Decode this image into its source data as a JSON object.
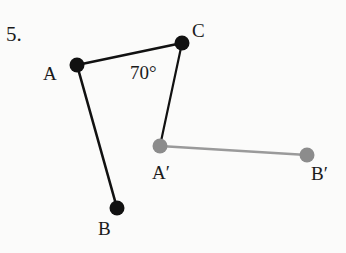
{
  "problem": {
    "number": "5."
  },
  "colors": {
    "original": "#111111",
    "image": "#8c8c8c",
    "image_line": "#9a9a9a",
    "background": "#fbfbfa"
  },
  "points": {
    "A": {
      "label": "A",
      "x": 77,
      "y": 65
    },
    "B": {
      "label": "B",
      "x": 117,
      "y": 208
    },
    "C": {
      "label": "C",
      "x": 182,
      "y": 43
    },
    "A_prime": {
      "label": "A′",
      "x": 160,
      "y": 146
    },
    "B_prime": {
      "label": "B′",
      "x": 307,
      "y": 155
    }
  },
  "segments": [
    {
      "from": "A",
      "to": "C",
      "style": "original"
    },
    {
      "from": "A",
      "to": "B",
      "style": "original"
    },
    {
      "from": "C",
      "to": "A_prime",
      "style": "original"
    },
    {
      "from": "A_prime",
      "to": "B_prime",
      "style": "image"
    }
  ],
  "angle_label": {
    "text": "70°",
    "vertex": "A"
  }
}
